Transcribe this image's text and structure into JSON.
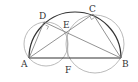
{
  "diagram": {
    "type": "geometry",
    "colors": {
      "main_stroke": "#333333",
      "aux_stroke": "#a8a8a8",
      "background": "#ffffff"
    },
    "points": {
      "A": {
        "label": "A",
        "x": 29,
        "y": 58
      },
      "B": {
        "label": "B",
        "x": 121,
        "y": 58
      },
      "C": {
        "label": "C",
        "x": 93,
        "y": 14
      },
      "D": {
        "label": "D",
        "x": 44,
        "y": 22
      },
      "E": {
        "label": "E",
        "x": 67,
        "y": 33
      },
      "F": {
        "label": "F",
        "x": 68,
        "y": 58
      }
    },
    "segments": [
      [
        "A",
        "B"
      ],
      [
        "A",
        "C"
      ],
      [
        "B",
        "D"
      ],
      [
        "A",
        "D"
      ],
      [
        "B",
        "C"
      ],
      [
        "E",
        "F"
      ]
    ],
    "arcs": [
      {
        "name": "semicircle-AB",
        "center": [
          75,
          58
        ],
        "radius": 46
      }
    ],
    "aux_circles": [
      {
        "name": "circle-ADEF",
        "center": [
          46,
          44
        ],
        "radius": 22
      },
      {
        "name": "circle-BCEF",
        "center": [
          95,
          44
        ],
        "radius": 29
      }
    ],
    "right_angle_marks": [
      "D",
      "C"
    ]
  }
}
